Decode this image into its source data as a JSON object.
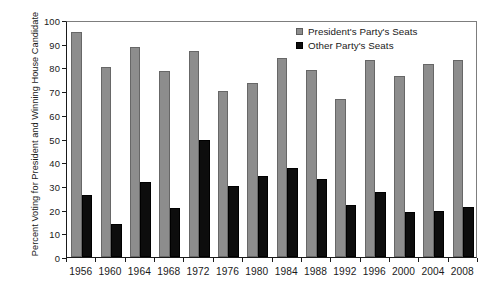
{
  "chart_data": {
    "type": "bar",
    "title": "",
    "subtitle": "",
    "xlabel": "",
    "ylabel": "Percent Voting for President and Winning House Candidate",
    "categories": [
      "1956",
      "1960",
      "1964",
      "1968",
      "1972",
      "1976",
      "1980",
      "1984",
      "1988",
      "1992",
      "1996",
      "2000",
      "2004",
      "2008"
    ],
    "series": [
      {
        "name": "President's Party's Seats",
        "color": "#8d8d8d",
        "values": [
          95,
          80,
          88.5,
          78.5,
          87,
          70,
          73.5,
          84,
          79,
          66.5,
          83,
          76.5,
          81.5,
          83
        ]
      },
      {
        "name": "Other Party's Seats",
        "color": "#0d0d0d",
        "values": [
          26,
          14,
          31.5,
          20.5,
          49.5,
          30,
          34,
          37.5,
          33,
          22,
          27.5,
          19,
          19.5,
          21
        ]
      }
    ],
    "ylim": [
      0,
      100
    ],
    "yticks": [
      0,
      10,
      20,
      30,
      40,
      50,
      60,
      70,
      80,
      90,
      100
    ],
    "ytick_labels": [
      "0",
      "10",
      "20",
      "30",
      "40",
      "50",
      "60",
      "70",
      "80",
      "90",
      "100"
    ],
    "grid": false,
    "legend_position": "top-right",
    "frame": true,
    "bar_orientation": "vertical",
    "grouped": true
  },
  "legend": {
    "entries": [
      {
        "label": "President's Party's Seats",
        "swatch": "pres"
      },
      {
        "label": "Other Party's Seats",
        "swatch": "other"
      }
    ]
  },
  "axes": {
    "y_title": "Percent Voting for President and Winning House Candidate"
  }
}
